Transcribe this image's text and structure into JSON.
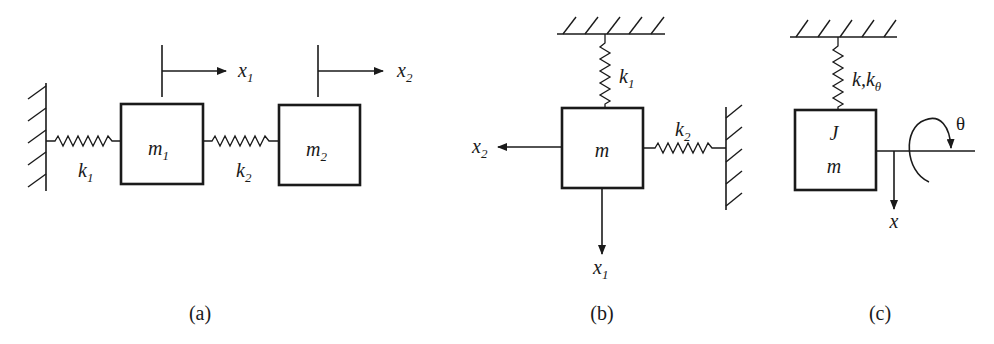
{
  "colors": {
    "ink": "#1a1a1a",
    "background": "#ffffff"
  },
  "panels": [
    {
      "caption": "(a)",
      "masses": [
        {
          "base": "m",
          "sub": "1"
        },
        {
          "base": "m",
          "sub": "2"
        }
      ],
      "springs": [
        {
          "base": "k",
          "sub": "1"
        },
        {
          "base": "k",
          "sub": "2"
        }
      ],
      "displacements": [
        {
          "base": "x",
          "sub": "1",
          "direction": "right"
        },
        {
          "base": "x",
          "sub": "2",
          "direction": "right"
        }
      ]
    },
    {
      "caption": "(b)",
      "mass": {
        "base": "m"
      },
      "springs": [
        {
          "base": "k",
          "sub": "1",
          "orientation": "vertical"
        },
        {
          "base": "k",
          "sub": "2",
          "orientation": "horizontal"
        }
      ],
      "displacements": [
        {
          "base": "x",
          "sub": "1",
          "direction": "down"
        },
        {
          "base": "x",
          "sub": "2",
          "direction": "left"
        }
      ]
    },
    {
      "caption": "(c)",
      "mass": {
        "inertia": "J",
        "base": "m"
      },
      "spring": {
        "base": "k,k",
        "sub": "θ"
      },
      "displacement": {
        "base": "x",
        "direction": "down"
      },
      "rotation": {
        "label": "θ"
      }
    }
  ]
}
